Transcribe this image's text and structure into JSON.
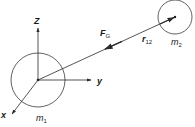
{
  "diagram": {
    "colors": {
      "stroke": "#2a2a2a",
      "text": "#1a1a1a",
      "background": "#ffffff"
    },
    "axes": {
      "z_label": "Z",
      "y_label": "y",
      "x_label": "x"
    },
    "masses": {
      "m1": {
        "base": "m",
        "sub": "1"
      },
      "m2": {
        "base": "m",
        "sub": "2"
      }
    },
    "vectors": {
      "force": {
        "base": "F",
        "sub": "G"
      },
      "distance": {
        "base": "r",
        "sub": "12"
      }
    }
  }
}
